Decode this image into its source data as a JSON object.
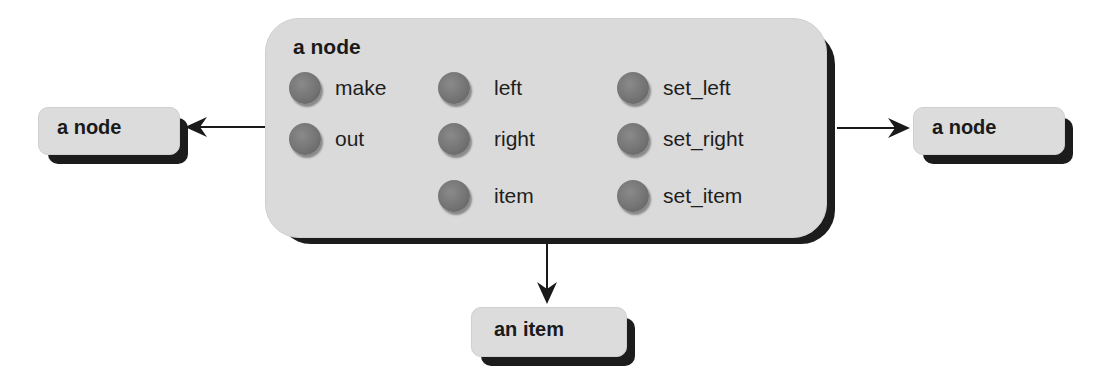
{
  "diagram": {
    "main_node": {
      "title": "a node",
      "features": [
        {
          "label": "make",
          "column": 0,
          "row": 0
        },
        {
          "label": "out",
          "column": 0,
          "row": 1
        },
        {
          "label": "left",
          "column": 1,
          "row": 0
        },
        {
          "label": "right",
          "column": 1,
          "row": 1
        },
        {
          "label": "item",
          "column": 1,
          "row": 2
        },
        {
          "label": "set_left",
          "column": 2,
          "row": 0
        },
        {
          "label": "set_right",
          "column": 2,
          "row": 1
        },
        {
          "label": "set_item",
          "column": 2,
          "row": 2
        }
      ]
    },
    "left_node": {
      "label": "a node"
    },
    "right_node": {
      "label": "a node"
    },
    "bottom_node": {
      "label": "an item"
    },
    "edges": [
      {
        "from": "main_node",
        "to": "left_node",
        "direction": "left"
      },
      {
        "from": "main_node",
        "to": "right_node",
        "direction": "right"
      },
      {
        "from": "main_node",
        "to": "bottom_node",
        "direction": "down"
      }
    ],
    "colors": {
      "box_fill": "#dadada",
      "shadow": "#1c1c1c",
      "dot": "#747474",
      "text": "#1a1a1a"
    }
  }
}
